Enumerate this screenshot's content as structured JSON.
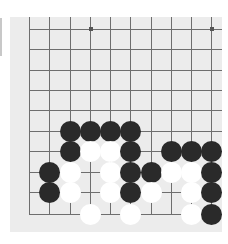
{
  "board": {
    "background": "#ececec",
    "line_color": "#6e6e6e",
    "grid_x": [
      29,
      49,
      70,
      90,
      110,
      130,
      151,
      171,
      191,
      211
    ],
    "grid_y": [
      29,
      49,
      70,
      90,
      110,
      131,
      151,
      172,
      192,
      214
    ],
    "star_points": [
      [
        90,
        28
      ],
      [
        211,
        28
      ]
    ]
  },
  "stones": [
    {
      "color": "black",
      "col": 2,
      "row": 5
    },
    {
      "color": "black",
      "col": 3,
      "row": 5
    },
    {
      "color": "black",
      "col": 4,
      "row": 5
    },
    {
      "color": "black",
      "col": 5,
      "row": 5
    },
    {
      "color": "black",
      "col": 2,
      "row": 6
    },
    {
      "color": "white",
      "col": 3,
      "row": 6
    },
    {
      "color": "white",
      "col": 4,
      "row": 6
    },
    {
      "color": "black",
      "col": 5,
      "row": 6
    },
    {
      "color": "black",
      "col": 7,
      "row": 6
    },
    {
      "color": "black",
      "col": 8,
      "row": 6
    },
    {
      "color": "black",
      "col": 9,
      "row": 6
    },
    {
      "color": "black",
      "col": 1,
      "row": 7
    },
    {
      "color": "white",
      "col": 2,
      "row": 7
    },
    {
      "color": "white",
      "col": 4,
      "row": 7
    },
    {
      "color": "black",
      "col": 5,
      "row": 7
    },
    {
      "color": "black",
      "col": 6,
      "row": 7
    },
    {
      "color": "white",
      "col": 7,
      "row": 7
    },
    {
      "color": "white",
      "col": 8,
      "row": 7
    },
    {
      "color": "black",
      "col": 9,
      "row": 7
    },
    {
      "color": "black",
      "col": 1,
      "row": 8
    },
    {
      "color": "white",
      "col": 2,
      "row": 8
    },
    {
      "color": "white",
      "col": 4,
      "row": 8
    },
    {
      "color": "black",
      "col": 5,
      "row": 8
    },
    {
      "color": "white",
      "col": 6,
      "row": 8
    },
    {
      "color": "white",
      "col": 8,
      "row": 8
    },
    {
      "color": "black",
      "col": 9,
      "row": 8
    },
    {
      "color": "white",
      "col": 3,
      "row": 9
    },
    {
      "color": "white",
      "col": 5,
      "row": 9
    },
    {
      "color": "white",
      "col": 8,
      "row": 9
    },
    {
      "color": "black",
      "col": 9,
      "row": 9
    }
  ]
}
